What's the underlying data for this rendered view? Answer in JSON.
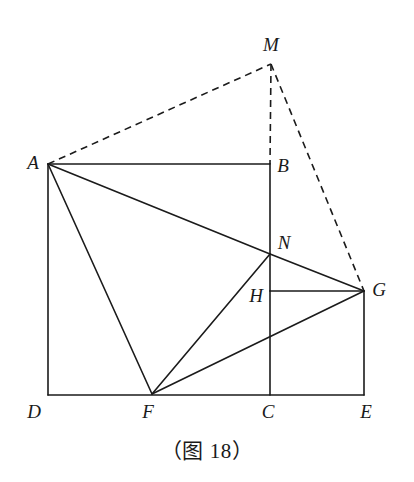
{
  "figure": {
    "caption": "（图 18）",
    "canvas": {
      "width": 414,
      "height": 482
    },
    "stroke_color": "#1b1b1b",
    "background_color": "#ffffff",
    "solid_stroke_width": 1.6,
    "dashed_stroke_width": 1.6,
    "dash_pattern": "7,5",
    "points": {
      "A": {
        "label": "A",
        "x": 48,
        "y": 164,
        "label_x": 33,
        "label_y": 162
      },
      "B": {
        "label": "B",
        "x": 270,
        "y": 164,
        "label_x": 283,
        "label_y": 165
      },
      "C": {
        "label": "C",
        "x": 270,
        "y": 395,
        "label_x": 268,
        "label_y": 411
      },
      "D": {
        "label": "D",
        "x": 48,
        "y": 395,
        "label_x": 34,
        "label_y": 411
      },
      "E": {
        "label": "E",
        "x": 364,
        "y": 395,
        "label_x": 366,
        "label_y": 411
      },
      "F": {
        "label": "F",
        "x": 152,
        "y": 394,
        "label_x": 148,
        "label_y": 411
      },
      "G": {
        "label": "G",
        "x": 364,
        "y": 291,
        "label_x": 379,
        "label_y": 289
      },
      "H": {
        "label": "H",
        "x": 270,
        "y": 291,
        "label_x": 256,
        "label_y": 295
      },
      "M": {
        "label": "M",
        "x": 271,
        "y": 64,
        "label_x": 271,
        "label_y": 44
      },
      "N": {
        "label": "N",
        "x": 270,
        "y": 254,
        "label_x": 284,
        "label_y": 242
      }
    },
    "solid_segments": [
      {
        "name": "segment-AB",
        "from": "A",
        "to": "B"
      },
      {
        "name": "segment-AD",
        "from": "A",
        "to": "D"
      },
      {
        "name": "segment-DE",
        "from": "D",
        "to": "E"
      },
      {
        "name": "segment-BN",
        "from": "B",
        "to": "N"
      },
      {
        "name": "segment-NH",
        "from": "N",
        "to": "H"
      },
      {
        "name": "segment-HC",
        "from": "H",
        "to": "C"
      },
      {
        "name": "segment-GE",
        "from": "G",
        "to": "E"
      },
      {
        "name": "segment-AN",
        "from": "A",
        "to": "N"
      },
      {
        "name": "segment-NG",
        "from": "N",
        "to": "G"
      },
      {
        "name": "segment-AF",
        "from": "A",
        "to": "F"
      },
      {
        "name": "segment-FN",
        "from": "F",
        "to": "N"
      },
      {
        "name": "segment-FG",
        "from": "F",
        "to": "G"
      },
      {
        "name": "segment-HG",
        "from": "H",
        "to": "G"
      }
    ],
    "dashed_segments": [
      {
        "name": "segment-AM",
        "from": "A",
        "to": "M"
      },
      {
        "name": "segment-MB",
        "from": "M",
        "to": "B"
      },
      {
        "name": "segment-MG",
        "from": "M",
        "to": "G"
      }
    ]
  }
}
